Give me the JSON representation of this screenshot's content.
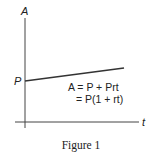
{
  "figure": {
    "caption": "Figure 1",
    "axes": {
      "y_label": "A",
      "x_label": "t"
    },
    "intercept_label": "P",
    "equation": {
      "line1": "A = P + Prt",
      "line2": "= P(1 + rt)"
    },
    "colors": {
      "line": "#333333",
      "axis": "#444444",
      "text": "#222222"
    }
  }
}
